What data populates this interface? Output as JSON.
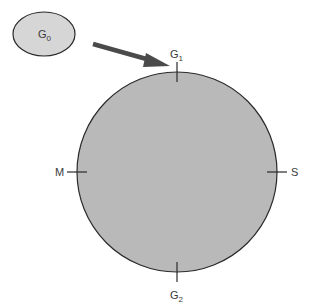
{
  "diagram": {
    "type": "cell-cycle",
    "colors": {
      "circle_fill": "#b9b9b9",
      "ellipse_fill": "#d6d6d6",
      "stroke": "#2a2a2a",
      "arrow": "#4a4a4a",
      "text": "#3a3a3a"
    },
    "g0": {
      "base": "G",
      "sub": "0"
    },
    "phases": {
      "g1": {
        "base": "G",
        "sub": "1"
      },
      "s": {
        "base": "S"
      },
      "g2": {
        "base": "G",
        "sub": "2"
      },
      "m": {
        "base": "M"
      }
    },
    "arrow": {
      "from": "G0",
      "to": "G1"
    }
  }
}
